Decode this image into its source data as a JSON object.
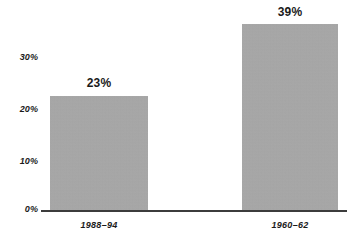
{
  "chart_data": {
    "type": "bar",
    "title": "",
    "subtitle": "",
    "xlabel": "",
    "ylabel": "",
    "categories": [
      "1988–94",
      "1960–62"
    ],
    "values": [
      23,
      39
    ],
    "value_labels": [
      "23%",
      "39%"
    ],
    "ylim": [
      0,
      40
    ],
    "yticks": [
      0,
      10,
      20,
      30
    ],
    "ytick_labels": [
      "0%",
      "10%",
      "20%",
      "30%"
    ],
    "grid": false,
    "legend": null,
    "legend_position": "none",
    "series": [
      {
        "name": "",
        "values": [
          23,
          39
        ]
      }
    ],
    "colors": {
      "bar_fill": "#a9a9a9",
      "axis_line": "#3c3c3c",
      "text": "#1a1a1a",
      "background": "#ffffff"
    }
  },
  "axis": {
    "ytick_0": "0%",
    "ytick_10": "10%",
    "ytick_20": "20%",
    "ytick_30": "30%"
  },
  "bars": {
    "left": {
      "category": "1988–94",
      "value_label": "23%"
    },
    "right": {
      "category": "1960–62",
      "value_label": "39%"
    }
  }
}
